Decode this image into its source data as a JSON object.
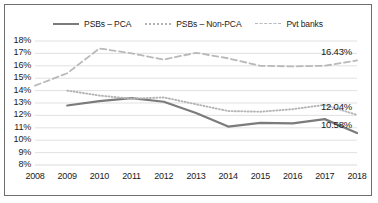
{
  "chart_data": {
    "type": "line",
    "title": "",
    "subtitle": "",
    "xlabel": "",
    "ylabel": "",
    "categories": [
      "2008",
      "2009",
      "2010",
      "2011",
      "2012",
      "2013",
      "2014",
      "2015",
      "2016",
      "2017",
      "2018"
    ],
    "ylim": [
      8,
      18
    ],
    "ytick_labels": [
      "18%",
      "17%",
      "16%",
      "15%",
      "14%",
      "13%",
      "12%",
      "11%",
      "10%",
      "9%",
      "8%"
    ],
    "ytick_values": [
      18,
      17,
      16,
      15,
      14,
      13,
      12,
      11,
      10,
      9,
      8
    ],
    "grid": true,
    "grid_axis": "y",
    "legend_position": "top-center",
    "series": [
      {
        "name": "PSBs – PCA",
        "style": "solid",
        "color": "#7b7b7b",
        "values": [
          null,
          12.8,
          13.15,
          13.4,
          13.1,
          12.2,
          11.1,
          11.4,
          11.35,
          11.7,
          10.58
        ],
        "end_label": "10.58%"
      },
      {
        "name": "PSBs – Non-PCA",
        "style": "dotted",
        "color": "#b4b4b4",
        "values": [
          null,
          14.0,
          13.6,
          13.35,
          13.45,
          12.9,
          12.35,
          12.3,
          12.5,
          12.85,
          12.04
        ],
        "end_label": "12.04%"
      },
      {
        "name": "Pvt banks",
        "style": "dashed",
        "color": "#b9b9b9",
        "values": [
          14.4,
          15.4,
          17.4,
          17.0,
          16.5,
          17.05,
          16.6,
          16.0,
          15.95,
          16.0,
          16.43
        ],
        "end_label": "16.43%"
      }
    ],
    "annotations": [
      {
        "text": "16.43%",
        "series": "Pvt banks",
        "x": "2018",
        "y": 16.43
      },
      {
        "text": "12.04%",
        "series": "PSBs – Non-PCA",
        "x": "2018",
        "y": 12.04
      },
      {
        "text": "10.58%",
        "series": "PSBs – PCA",
        "x": "2018",
        "y": 10.58
      }
    ],
    "colors": {
      "grid": "#d9d9d9",
      "border": "#6e6e6e",
      "text": "#1a1a1a",
      "background": "#ffffff"
    }
  }
}
